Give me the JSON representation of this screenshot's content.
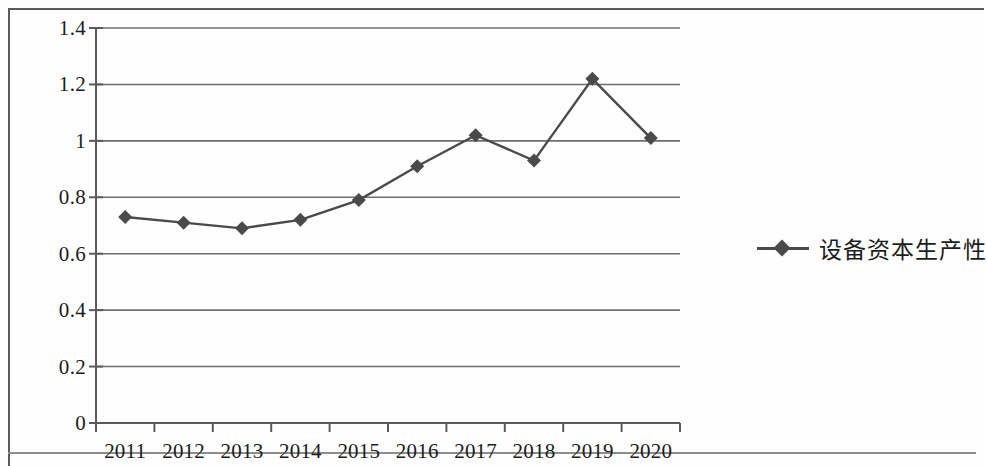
{
  "chart_data": {
    "type": "line",
    "title": "",
    "subtitle": "",
    "xlabel": "",
    "ylabel": "",
    "categories": [
      "2011",
      "2012",
      "2013",
      "2014",
      "2015",
      "2016",
      "2017",
      "2018",
      "2019",
      "2020"
    ],
    "series": [
      {
        "name": "设备资本生产性",
        "values": [
          0.73,
          0.71,
          0.69,
          0.72,
          0.79,
          0.91,
          1.02,
          0.93,
          1.22,
          1.01
        ],
        "color": "#4a4a4a",
        "marker": "diamond"
      }
    ],
    "ylim": [
      0,
      1.4
    ],
    "yticks": [
      "0",
      "0.2",
      "0.4",
      "0.6",
      "0.8",
      "1",
      "1.2",
      "1.4"
    ],
    "ytick_values": [
      0,
      0.2,
      0.4,
      0.6,
      0.8,
      1.0,
      1.2,
      1.4
    ],
    "grid": "horizontal",
    "legend_position": "right",
    "legend": [
      {
        "label": "设备资本生产性",
        "marker": "diamond-line",
        "color": "#4a4a4a"
      }
    ],
    "axis_color": "#5a5a5a",
    "grid_color": "#6e6e6e",
    "background": "#ffffff"
  }
}
